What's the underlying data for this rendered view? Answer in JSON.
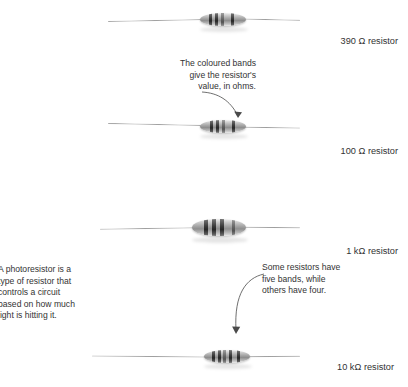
{
  "figure": {
    "background": "#ffffff",
    "text_color": "#333333"
  },
  "notes": {
    "intro": "tric\nof\nf a\nor\ns.",
    "coloured_bands": "The coloured bands\ngive the resistor's\nvalue, in ohms.",
    "photoresistor": "A photoresistor is a\ntype of resistor that\ncontrols a circuit\nbased on how much\nlight is hitting it.",
    "five_bands": "Some resistors have\nfive bands, while\nothers have four."
  },
  "resistors": [
    {
      "id": "resistor-390-ohm",
      "label": "390 Ω resistor",
      "band_count": 4,
      "value": "390",
      "unit": "Ω"
    },
    {
      "id": "resistor-100-ohm",
      "label": "100 Ω resistor",
      "band_count": 4,
      "value": "100",
      "unit": "Ω"
    },
    {
      "id": "resistor-1-kilohm",
      "label": "1 kΩ resistor",
      "band_count": 4,
      "value": "1",
      "unit": "kΩ"
    },
    {
      "id": "resistor-10-kilohm",
      "label": "10 kΩ resistor",
      "band_count": 5,
      "value": "10",
      "unit": "kΩ"
    }
  ]
}
